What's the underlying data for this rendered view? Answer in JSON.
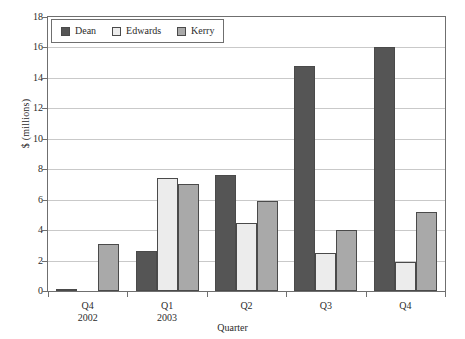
{
  "chart_data": {
    "type": "bar",
    "title": "",
    "xlabel": "Quarter",
    "ylabel": "$ (millions)",
    "categories": [
      "Q4",
      "Q1",
      "Q2",
      "Q3",
      "Q4"
    ],
    "category_sublabels": [
      "2002",
      "2003",
      "",
      "",
      ""
    ],
    "series": [
      {
        "name": "Dean",
        "color": "#555555",
        "values": [
          0.15,
          2.6,
          7.6,
          14.8,
          16.0
        ]
      },
      {
        "name": "Edwards",
        "color": "#ececec",
        "values": [
          0.0,
          7.4,
          4.5,
          2.5,
          1.9
        ]
      },
      {
        "name": "Kerry",
        "color": "#a9a9a9",
        "values": [
          3.1,
          7.0,
          5.9,
          4.0,
          5.2
        ]
      }
    ],
    "ylim": [
      0,
      18
    ],
    "y_ticks": [
      0,
      2,
      4,
      6,
      8,
      10,
      12,
      14,
      16,
      18
    ],
    "y_tick_labels": [
      "0",
      "2",
      "4",
      "6",
      "8",
      "10",
      "12",
      "14",
      "16",
      "18"
    ],
    "grid": true,
    "legend_position": "top-left",
    "bar_border_color": "#4a4a4a",
    "grid_color": "#c9c9c9",
    "axis_color": "#6f6f6f"
  }
}
